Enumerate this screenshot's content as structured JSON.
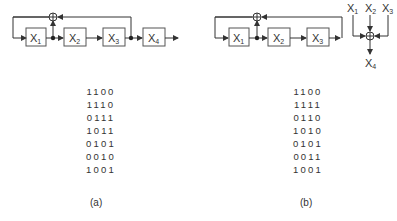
{
  "panel_a": {
    "registers": [
      "X",
      "X",
      "X",
      "X"
    ],
    "subscripts": [
      "1",
      "2",
      "3",
      "4"
    ],
    "sequence": [
      "1100",
      "1110",
      "0111",
      "1011",
      "0101",
      "0010",
      "1001"
    ],
    "caption": "(a)"
  },
  "panel_b": {
    "registers": [
      "X",
      "X",
      "X"
    ],
    "subscripts": [
      "1",
      "2",
      "3"
    ],
    "xor_inputs": [
      {
        "label": "X",
        "sub": "1"
      },
      {
        "label": "X",
        "sub": "2"
      },
      {
        "label": "X",
        "sub": "3"
      }
    ],
    "xor_output": {
      "label": "X",
      "sub": "4"
    },
    "sequence": [
      "1100",
      "1111",
      "0110",
      "1010",
      "0101",
      "0011",
      "1001"
    ],
    "caption": "(b)"
  },
  "colors": {
    "line": "#333333",
    "box_border": "#555555",
    "text": "#333333"
  }
}
